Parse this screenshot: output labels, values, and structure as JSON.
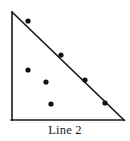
{
  "figure": {
    "caption": "Line 2",
    "type": "scatter-with-trend-line",
    "colors": {
      "axis": "#1a1a1a",
      "trend_line": "#1a1a1a",
      "point": "#111111",
      "background": "#ffffff",
      "text": "#1a1a1a"
    }
  },
  "chart_data": {
    "type": "scatter",
    "title": "Line 2",
    "xlabel": "",
    "ylabel": "",
    "grid": false,
    "legend": "none",
    "xlim": [
      0,
      100
    ],
    "ylim": [
      0,
      100
    ],
    "axes": {
      "y_axis": {
        "x": 12,
        "y_top": 12,
        "y_bottom": 120
      },
      "x_axis": {
        "y": 120,
        "x_left": 12,
        "x_right": 124
      }
    },
    "trend_line": {
      "name": "Line 2",
      "x1": 12,
      "y1": 12,
      "x2": 124,
      "y2": 120,
      "slope": -0.964,
      "intercept": 100
    },
    "points_px": [
      {
        "x": 28,
        "y": 21
      },
      {
        "x": 61,
        "y": 55
      },
      {
        "x": 28,
        "y": 70
      },
      {
        "x": 46,
        "y": 82
      },
      {
        "x": 85,
        "y": 80
      },
      {
        "x": 51,
        "y": 104
      },
      {
        "x": 105,
        "y": 103
      }
    ],
    "points_data": [
      {
        "x": 14,
        "y": 92
      },
      {
        "x": 44,
        "y": 60
      },
      {
        "x": 14,
        "y": 46
      },
      {
        "x": 30,
        "y": 35
      },
      {
        "x": 65,
        "y": 37
      },
      {
        "x": 35,
        "y": 15
      },
      {
        "x": 83,
        "y": 16
      }
    ],
    "point_count": 7,
    "point_radius_px": 2.6,
    "axis_stroke_px": 1.6,
    "line_stroke_px": 1.7
  }
}
